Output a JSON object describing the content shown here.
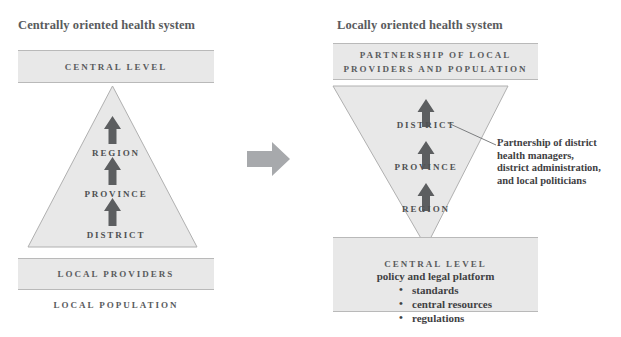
{
  "diagram": {
    "title_left": "Centrally oriented health system",
    "title_right": "Locally oriented health system",
    "transition_arrow_icon": "right-arrow-icon",
    "colors": {
      "shape_fill": "#e8e8e8",
      "shape_stroke": "#b9b9b9",
      "arrow_gray": "#5c5e60",
      "big_arrow_gray": "#a7a9ac",
      "text_gray": "#595b5d",
      "background": "#ffffff"
    }
  },
  "left_panel": {
    "top_box_label": "CENTRAL LEVEL",
    "pyramid": {
      "orientation": "apex-up",
      "tiers": [
        "REGION",
        "PROVINCE",
        "DISTRICT"
      ],
      "flow_arrows": 3,
      "flow_direction": "upward"
    },
    "bottom_box_label": "LOCAL PROVIDERS",
    "footer_label": "LOCAL POPULATION"
  },
  "right_panel": {
    "top_box_label_line1": "PARTNERSHIP OF LOCAL",
    "top_box_label_line2": "PROVIDERS AND POPULATION",
    "pyramid": {
      "orientation": "apex-down",
      "tiers": [
        "DISTRICT",
        "PROVINCE",
        "REGION"
      ],
      "flow_arrows": 3,
      "flow_direction": "upward"
    },
    "bottom_box": {
      "title": "CENTRAL LEVEL",
      "subtitle": "policy and legal platform",
      "bullets": [
        "standards",
        "central resources",
        "regulations"
      ]
    },
    "annotation": {
      "line1": "Partnership of district",
      "line2": "health managers,",
      "line3": "district administration,",
      "line4": "and local politicians"
    }
  }
}
